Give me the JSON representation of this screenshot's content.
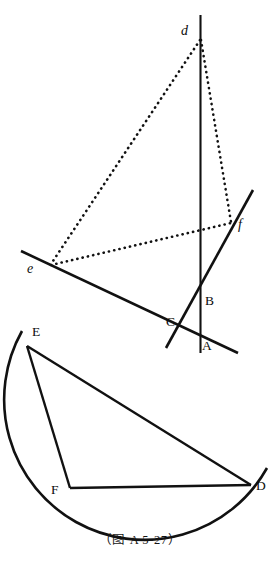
{
  "figure": {
    "caption": "（图 A 5-27）",
    "stroke_color": "#111111",
    "background_color": "#ffffff",
    "upper_labels": [
      {
        "id": "d",
        "text": "d",
        "x": 182,
        "y": 26,
        "style": "italic"
      },
      {
        "id": "f",
        "text": "f",
        "x": 238,
        "y": 219,
        "style": "italic"
      },
      {
        "id": "e",
        "text": "e",
        "x": 28,
        "y": 262,
        "style": "italic"
      },
      {
        "id": "B",
        "text": "B",
        "x": 206,
        "y": 295,
        "style": "upright"
      },
      {
        "id": "C",
        "text": "C",
        "x": 168,
        "y": 316,
        "style": "upright"
      },
      {
        "id": "A",
        "text": "A",
        "x": 203,
        "y": 340,
        "style": "upright"
      }
    ],
    "lower_labels": [
      {
        "id": "E",
        "text": "E",
        "x": 32,
        "y": 326,
        "style": "upright"
      },
      {
        "id": "F",
        "text": "F",
        "x": 52,
        "y": 484,
        "style": "upright"
      },
      {
        "id": "D",
        "text": "D",
        "x": 256,
        "y": 480,
        "style": "upright"
      }
    ],
    "points": {
      "d": {
        "x": 200,
        "y": 39
      },
      "e": {
        "x": 50,
        "y": 264
      },
      "f": {
        "x": 231,
        "y": 222
      },
      "A": {
        "x": 200,
        "y": 352
      },
      "B": {
        "x": 200,
        "y": 305
      },
      "C": {
        "x": 181,
        "y": 339
      },
      "E": {
        "x": 27,
        "y": 346
      },
      "F": {
        "x": 70,
        "y": 487
      },
      "D": {
        "x": 250,
        "y": 485
      }
    },
    "dotted_triangle": {
      "name": "triangle-def",
      "vertices": [
        "d",
        "e",
        "f"
      ],
      "line_style": "dotted"
    },
    "solid_lines": [
      {
        "name": "vertical-line-d-A",
        "x1": 200,
        "y1": 15,
        "x2": 200,
        "y2": 352
      },
      {
        "name": "line-through-e",
        "x1": 22,
        "y1": 252,
        "x2": 237,
        "y2": 352
      },
      {
        "name": "line-through-f",
        "x1": 252,
        "y1": 191,
        "x2": 167,
        "y2": 347
      }
    ],
    "lower_chords": [
      {
        "name": "chord-E-D",
        "from": "E",
        "to": "D"
      },
      {
        "name": "chord-E-F",
        "from": "E",
        "to": "F"
      },
      {
        "name": "chord-F-D",
        "from": "F",
        "to": "D"
      }
    ],
    "arc": {
      "name": "circle-arc-E-D",
      "start": {
        "x": 22,
        "y": 332
      },
      "end": {
        "x": 266,
        "y": 469
      },
      "bottom": {
        "x": 145,
        "y": 517
      },
      "sweep": "major-lower"
    }
  }
}
